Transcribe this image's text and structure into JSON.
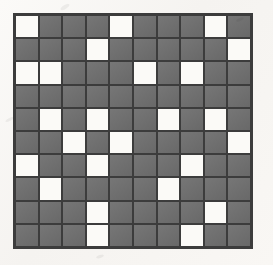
{
  "figure": {
    "kind": "binary-grid-pattern",
    "title": "10 by 10 shaded square grid",
    "rows": 10,
    "columns": 10,
    "cell_size_px": 24,
    "shaded_label": "shaded",
    "blank_label": "blank",
    "shaded_count": 72,
    "blank_count": 28
  },
  "colors": {
    "paper": "#f8f6f3",
    "shaded": "#6f6f6f",
    "blank": "#fbfaf7",
    "gridline": "#3c3c3c",
    "border": "#3c3c3c"
  },
  "chart_data": {
    "type": "heatmap",
    "title": "10 by 10 shaded square grid",
    "xlabel": "",
    "ylabel": "",
    "categories_x": [
      "1",
      "2",
      "3",
      "4",
      "5",
      "6",
      "7",
      "8",
      "9",
      "10"
    ],
    "categories_y": [
      "1",
      "2",
      "3",
      "4",
      "5",
      "6",
      "7",
      "8",
      "9",
      "10"
    ],
    "legend": [
      "0 = blank",
      "1 = shaded"
    ],
    "values": [
      [
        0,
        1,
        1,
        1,
        0,
        1,
        1,
        1,
        0,
        1
      ],
      [
        1,
        1,
        1,
        0,
        1,
        1,
        1,
        1,
        1,
        0
      ],
      [
        0,
        0,
        1,
        1,
        1,
        0,
        1,
        0,
        1,
        1
      ],
      [
        1,
        1,
        1,
        1,
        1,
        1,
        1,
        1,
        1,
        1
      ],
      [
        1,
        0,
        1,
        0,
        1,
        1,
        0,
        1,
        0,
        1
      ],
      [
        1,
        1,
        0,
        1,
        0,
        1,
        1,
        1,
        1,
        0
      ],
      [
        0,
        1,
        1,
        0,
        1,
        1,
        1,
        0,
        1,
        1
      ],
      [
        1,
        0,
        1,
        1,
        1,
        1,
        0,
        1,
        1,
        1
      ],
      [
        1,
        1,
        1,
        0,
        1,
        1,
        1,
        1,
        0,
        1
      ],
      [
        1,
        1,
        1,
        0,
        1,
        1,
        1,
        0,
        1,
        1
      ]
    ],
    "blank_positions": [
      [
        1,
        1
      ],
      [
        1,
        5
      ],
      [
        1,
        9
      ],
      [
        2,
        4
      ],
      [
        2,
        10
      ],
      [
        3,
        1
      ],
      [
        3,
        2
      ],
      [
        3,
        6
      ],
      [
        3,
        8
      ],
      [
        5,
        2
      ],
      [
        5,
        4
      ],
      [
        5,
        7
      ],
      [
        5,
        9
      ],
      [
        6,
        3
      ],
      [
        6,
        5
      ],
      [
        6,
        10
      ],
      [
        7,
        1
      ],
      [
        7,
        4
      ],
      [
        7,
        8
      ],
      [
        8,
        2
      ],
      [
        8,
        7
      ],
      [
        9,
        4
      ],
      [
        9,
        9
      ],
      [
        10,
        4
      ],
      [
        10,
        8
      ]
    ]
  }
}
